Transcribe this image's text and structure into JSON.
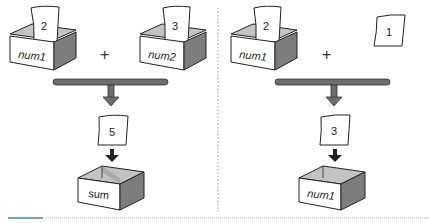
{
  "diagram": {
    "left_panel": {
      "operand1": {
        "box_label": "num1",
        "paper_value": "2"
      },
      "operator": "+",
      "operand2": {
        "box_label": "num2",
        "paper_value": "3"
      },
      "result_paper_value": "5",
      "target": {
        "box_label": "sum"
      }
    },
    "right_panel": {
      "operand1": {
        "box_label": "num1",
        "paper_value": "2"
      },
      "operator": "+",
      "operand2": {
        "paper_value": "1"
      },
      "result_paper_value": "3",
      "target": {
        "box_label": "num1"
      }
    }
  },
  "colors": {
    "bar": "#6e6e6e",
    "bar_outline": "#333333",
    "box_front": "#ffffff",
    "box_side": "#8a8a8a",
    "box_inner": "#bdbdbd",
    "outline": "#222222",
    "divider": "#9a9a9a",
    "accent_bottom": "#6fa6c9"
  }
}
